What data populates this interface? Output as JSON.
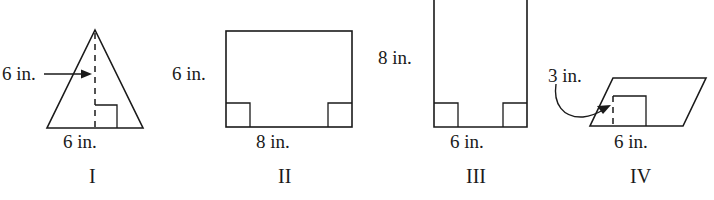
{
  "page": {
    "background_color": "#ffffff",
    "ink_color": "#1a1a1a"
  },
  "figures": [
    {
      "id": "figure-1",
      "roman_label": "I",
      "shape": "triangle",
      "shape_description": "isosceles triangle with dashed vertical height and right-angle mark at base",
      "labels": {
        "height": "6 in.",
        "base": "6 in."
      },
      "marks": {
        "height_line": "dashed",
        "height_arrow": "horizontal arrow pointing right toward the dashed height line",
        "right_angle": "square at the foot of the height, right side"
      }
    },
    {
      "id": "figure-2",
      "roman_label": "II",
      "shape": "rectangle",
      "shape_description": "rectangle with right-angle squares at both bottom corners",
      "labels": {
        "height": "6 in.",
        "base": "8 in."
      },
      "marks": {
        "right_angle_left": "square at bottom-left interior corner",
        "right_angle_right": "square at bottom-right interior corner"
      }
    },
    {
      "id": "figure-3",
      "roman_label": "III",
      "shape": "rectangle",
      "shape_description": "tall rectangle, top edge cropped by the image border, right-angle squares at both bottom corners",
      "labels": {
        "height": "8 in.",
        "base": "6 in."
      },
      "marks": {
        "right_angle_left": "square at bottom-left interior corner",
        "right_angle_right": "square at bottom-right interior corner"
      }
    },
    {
      "id": "figure-4",
      "roman_label": "IV",
      "shape": "parallelogram",
      "shape_description": "parallelogram slanting to the right with interior height segment and right-angle mark",
      "labels": {
        "height": "3 in.",
        "base": "6 in."
      },
      "marks": {
        "height_line": "dashed vertical segment inside the parallelogram",
        "right_angle": "square at the foot of the interior height",
        "curved_arrow": "curved arrow from the 3 in. label to the interior height"
      }
    }
  ]
}
